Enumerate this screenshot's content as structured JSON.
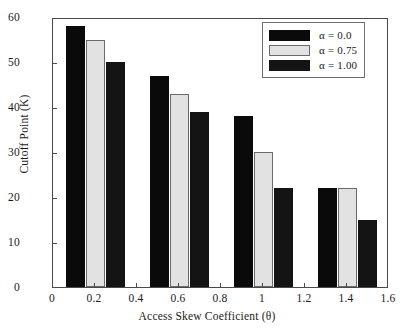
{
  "chart_data": {
    "type": "bar",
    "title": "",
    "xlabel": "Access Skew Coefficient (θ)",
    "ylabel": "Cutoff Point (K)",
    "categories": [
      0.2,
      0.6,
      1.0,
      1.4
    ],
    "series": [
      {
        "name": "α = 0.0",
        "color": "#0a0a0a",
        "values": [
          58,
          47,
          38,
          22
        ]
      },
      {
        "name": "α = 0.75",
        "color": "#e2e2e2",
        "values": [
          55,
          43,
          30,
          22
        ]
      },
      {
        "name": "α = 1.00",
        "color": "#141414",
        "values": [
          50,
          39,
          22,
          15
        ]
      }
    ],
    "xlim": [
      0,
      1.6
    ],
    "ylim": [
      0,
      60
    ],
    "xticks": [
      "0",
      "0.2",
      "0.4",
      "0.6",
      "0.8",
      "1",
      "1.2",
      "1.4",
      "1.6"
    ],
    "xtick_values": [
      0,
      0.2,
      0.4,
      0.6,
      0.8,
      1,
      1.2,
      1.4,
      1.6
    ],
    "yticks": [
      "0",
      "10",
      "20",
      "30",
      "40",
      "50",
      "60"
    ],
    "ytick_values": [
      0,
      10,
      20,
      30,
      40,
      50,
      60
    ],
    "grid": false,
    "legend_position": "upper right"
  }
}
